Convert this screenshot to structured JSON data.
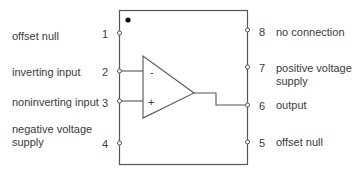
{
  "diagram": {
    "orientation_dot": true,
    "op_amp": {
      "inverting_symbol": "-",
      "noninverting_symbol": "+"
    },
    "pins_left": [
      {
        "number": "1",
        "label": "offset null"
      },
      {
        "number": "2",
        "label": "inverting input"
      },
      {
        "number": "3",
        "label": "noninverting input"
      },
      {
        "number": "4",
        "label": "negative voltage supply",
        "label_line1": "negative voltage",
        "label_line2": "supply"
      }
    ],
    "pins_right": [
      {
        "number": "8",
        "label": "no connection"
      },
      {
        "number": "7",
        "label": "positive voltage supply",
        "label_line1": "positive voltage",
        "label_line2": "supply"
      },
      {
        "number": "6",
        "label": "output"
      },
      {
        "number": "5",
        "label": "offset null"
      }
    ],
    "colors": {
      "line": "#555555",
      "text": "#3a3a3a",
      "background": "#ffffff"
    }
  }
}
